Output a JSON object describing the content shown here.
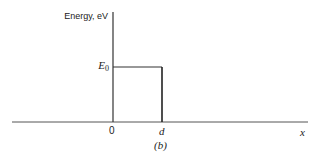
{
  "diagram": {
    "type": "potential-energy-barrier",
    "y_axis_label": "Energy, eV",
    "x_axis_label": "x",
    "level_label": "E",
    "level_subscript": "0",
    "x_ticks": [
      {
        "label": "0",
        "position": "left edge of barrier"
      },
      {
        "label": "d",
        "position": "right edge of barrier"
      }
    ],
    "caption": "(b)",
    "barrier": {
      "from": "0",
      "to": "d",
      "height": "E0"
    },
    "line_color": "#333333"
  }
}
